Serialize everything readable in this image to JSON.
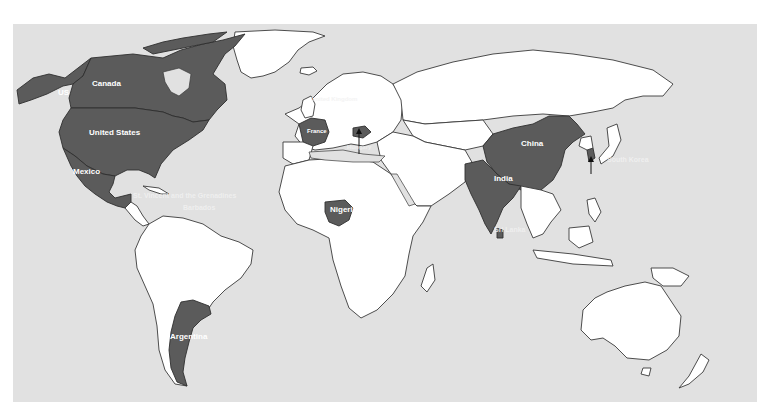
{
  "map": {
    "type": "choropleth-world-map",
    "colors": {
      "ocean": "#e1e1e1",
      "land": "#ffffff",
      "highlighted": "#5b5b5b",
      "border": "#3a3a3a",
      "label": "#ffffff",
      "page_background": "#ffffff"
    },
    "highlighted_countries": [
      "US",
      "Canada",
      "United States",
      "Mexico",
      "St. Vincent and the Grenadines",
      "Barbados",
      "France",
      "Hungary",
      "Nigeria",
      "India",
      "Sri Lanka",
      "China",
      "South Korea",
      "Argentina"
    ],
    "labels": {
      "alaska": "US",
      "canada": "Canada",
      "usa": "United States",
      "mexico": "Mexico",
      "st_vincent": "St. Vincent and the Grenadines",
      "barbados": "Barbados",
      "uk": "United Kingdom",
      "france": "France",
      "hungary": "Hungary",
      "nigeria": "Nigeria",
      "china": "China",
      "india": "India",
      "sri_lanka": "Sri Lanka",
      "south_korea": "South Korea",
      "argentina": "Argentina"
    }
  }
}
